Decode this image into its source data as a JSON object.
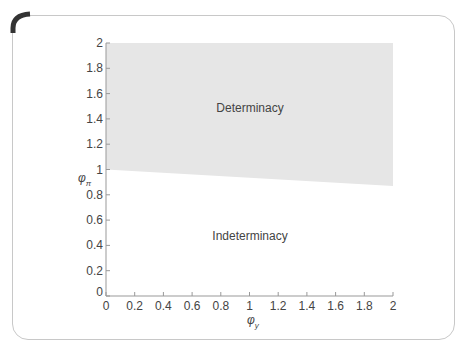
{
  "chart_data": {
    "type": "area",
    "title": "",
    "xlabel": "φ_y",
    "ylabel": "φ_π",
    "xlim": [
      0,
      2
    ],
    "ylim": [
      0,
      2
    ],
    "x_ticks": [
      "0",
      "0.2",
      "0.4",
      "0.6",
      "0.8",
      "1",
      "1.2",
      "1.4",
      "1.6",
      "1.8",
      "2"
    ],
    "y_ticks": [
      "0",
      "0.2",
      "0.4",
      "0.6",
      "0.8",
      "1",
      "1.2",
      "1.4",
      "1.6",
      "1.8",
      "2"
    ],
    "grid": false,
    "boundary": {
      "x": [
        0,
        2
      ],
      "y": [
        1.0,
        0.87
      ]
    },
    "regions": [
      {
        "name": "Determinacy",
        "position": "above boundary",
        "fill": "#e6e6e6"
      },
      {
        "name": "Indeterminacy",
        "position": "below boundary",
        "fill": "#ffffff"
      }
    ],
    "annotations": [
      {
        "text": "Determinacy",
        "x": 1.2,
        "y": 1.45
      },
      {
        "text": "Indeterminacy",
        "x": 1.2,
        "y": 0.45
      }
    ]
  },
  "labels": {
    "determinacy": "Determinacy",
    "indeterminacy": "Indeterminacy",
    "xlabel_main": "φ",
    "xlabel_sub": "y",
    "ylabel_main": "φ",
    "ylabel_sub": "π"
  },
  "ticks": {
    "x": [
      "0",
      "0.2",
      "0.4",
      "0.6",
      "0.8",
      "1",
      "1.2",
      "1.4",
      "1.6",
      "1.8",
      "2"
    ],
    "y": [
      "0",
      "0.2",
      "0.4",
      "0.6",
      "0.8",
      "1",
      "1.2",
      "1.4",
      "1.6",
      "1.8",
      "2"
    ]
  },
  "colors": {
    "region_fill": "#e6e6e6",
    "axis": "#999999",
    "text": "#444444",
    "corner": "#333333"
  }
}
